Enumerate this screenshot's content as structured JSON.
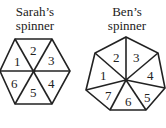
{
  "spinners": [
    {
      "title_line1": "Sarah’s",
      "title_line2": "spinner",
      "shape": "hexagon",
      "sections": [
        "1",
        "2",
        "3",
        "4",
        "5",
        "6"
      ]
    },
    {
      "title_line1": "Ben’s",
      "title_line2": "spinner",
      "shape": "heptagon",
      "sections": [
        "1",
        "2",
        "3",
        "4",
        "5",
        "6",
        "7"
      ]
    }
  ]
}
